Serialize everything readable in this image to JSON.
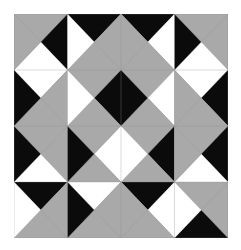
{
  "figure": {
    "kind": "tiling-pattern",
    "width": 241,
    "height": 250,
    "background_color": "#ffffff"
  },
  "canvas": {
    "origin_x": 14,
    "origin_y": 14,
    "pattern_width": 214,
    "pattern_height": 224,
    "border_color": "#ffffff",
    "gridline_color": "#8c8c8c",
    "gridline_width": 0.6
  },
  "palette": {
    "black": "#0b0b0b",
    "gray": "#a9a9a9",
    "gray_light": "#c2c2c2",
    "gray_dark": "#8f8f8f",
    "white": "#ffffff",
    "hatch_line": "#8a8a8a"
  },
  "grid": {
    "columns": 4,
    "rows": 4,
    "tile_width": 53.5,
    "tile_height": 56.0
  },
  "legend_note": "Each square tile is split by its two diagonals into four triangles (top, right, bottom, left). Each triangle is filled black, gray, or white; gray triangles carry fine diagonal hatching.",
  "tiles": [
    {
      "row": 0,
      "col": 0,
      "top": "gray",
      "right": "black",
      "bottom": "white",
      "left": "gray"
    },
    {
      "row": 0,
      "col": 1,
      "top": "black",
      "right": "gray",
      "bottom": "gray",
      "left": "white"
    },
    {
      "row": 0,
      "col": 2,
      "top": "black",
      "right": "white",
      "bottom": "gray",
      "left": "gray"
    },
    {
      "row": 0,
      "col": 3,
      "top": "gray",
      "right": "gray",
      "bottom": "white",
      "left": "black"
    },
    {
      "row": 1,
      "col": 0,
      "top": "white",
      "right": "gray",
      "bottom": "gray",
      "left": "black"
    },
    {
      "row": 1,
      "col": 1,
      "top": "gray",
      "right": "black",
      "bottom": "gray",
      "left": "white"
    },
    {
      "row": 1,
      "col": 2,
      "top": "gray",
      "right": "white",
      "bottom": "gray",
      "left": "black"
    },
    {
      "row": 1,
      "col": 3,
      "top": "white",
      "right": "black",
      "bottom": "gray",
      "left": "gray"
    },
    {
      "row": 2,
      "col": 0,
      "top": "gray",
      "right": "gray",
      "bottom": "white",
      "left": "black"
    },
    {
      "row": 2,
      "col": 1,
      "top": "gray",
      "right": "white",
      "bottom": "gray",
      "left": "black"
    },
    {
      "row": 2,
      "col": 2,
      "top": "gray",
      "right": "black",
      "bottom": "gray",
      "left": "white"
    },
    {
      "row": 2,
      "col": 3,
      "top": "gray",
      "right": "black",
      "bottom": "white",
      "left": "gray"
    },
    {
      "row": 3,
      "col": 0,
      "top": "black",
      "right": "gray",
      "bottom": "gray",
      "left": "white"
    },
    {
      "row": 3,
      "col": 1,
      "top": "white",
      "right": "gray",
      "bottom": "gray",
      "left": "black"
    },
    {
      "row": 3,
      "col": 2,
      "top": "black",
      "right": "white",
      "bottom": "gray",
      "left": "gray"
    },
    {
      "row": 3,
      "col": 3,
      "top": "gray",
      "right": "gray",
      "bottom": "black",
      "left": "white"
    }
  ]
}
